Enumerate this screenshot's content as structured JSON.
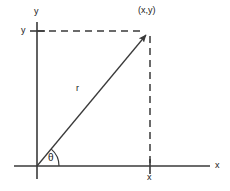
{
  "figure": {
    "background_color": "#ffffff",
    "stroke_color": "#3a3a3a",
    "text_color": "#1a1a1a"
  },
  "axes": {
    "x_axis_label": "x",
    "y_axis_label": "y",
    "x_axis": {
      "x1": 14,
      "y1": 166,
      "x2": 210,
      "y2": 166
    },
    "y_axis": {
      "x1": 37,
      "y1": 22,
      "x2": 37,
      "y2": 179
    },
    "x_axis_label_pos": {
      "x": 215,
      "y": 161
    },
    "y_axis_label_pos": {
      "x": 34,
      "y": 7
    }
  },
  "ticks": [
    {
      "name": "y-value-tick",
      "label": "y",
      "axis": "y",
      "x": 37,
      "y": 31,
      "label_x": 21,
      "label_y": 26
    },
    {
      "name": "x-value-tick",
      "label": "x",
      "axis": "x",
      "x": 150,
      "y": 166,
      "label_x": 147,
      "label_y": 173
    }
  ],
  "point": {
    "label": "(x,y)",
    "x": 150,
    "y": 31,
    "label_x": 138,
    "label_y": 6
  },
  "radius": {
    "label": "r",
    "label_x": 76,
    "label_y": 84,
    "from": {
      "x": 37,
      "y": 166
    },
    "to": {
      "x": 150,
      "y": 31
    }
  },
  "angle": {
    "label": "θ",
    "label_x": 48,
    "label_y": 153,
    "arc_radius": 22,
    "degrees": 50
  },
  "dashed_lines": [
    {
      "name": "horizontal-projection",
      "x1": 37,
      "y1": 31,
      "x2": 148,
      "y2": 31
    },
    {
      "name": "vertical-projection",
      "x1": 150,
      "y1": 33,
      "x2": 150,
      "y2": 166
    }
  ]
}
